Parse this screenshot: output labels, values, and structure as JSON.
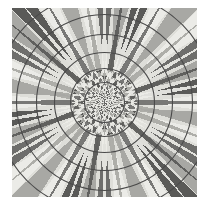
{
  "document": {
    "title": "Radial Moire Pattern",
    "kind": "optical-illusion-figure",
    "background_color": "#ffffff"
  },
  "figure": {
    "name": "radial-checkerboard-with-concentric-circles",
    "bounds": {
      "x": 12,
      "y": 8,
      "width": 185,
      "height": 189
    },
    "center": {
      "x": 104.5,
      "y": 102.5
    },
    "colors": {
      "light_wedge": "#ebebe7",
      "mid_wedge": "#a8a8a4",
      "dark_wedge": "#6e6e6c",
      "darkest_wedge": "#5a5a58",
      "circle_stroke": "#4a4a4a",
      "page_background": "#ffffff",
      "plate_background": "#dedeD9"
    },
    "radial": {
      "sector_count": 36,
      "sector_angle_degrees": 10,
      "ring_count": 13,
      "ring_growth": "geometric",
      "ring_base_radius": 3.2,
      "ring_growth_factor": 1.235,
      "max_radius": 138,
      "checker_phase_alternates_per_ring": true
    },
    "circles": {
      "stroke_width": 1.1,
      "stroke_color": "#4a4a4a",
      "radii": [
        20,
        34,
        50,
        68,
        88,
        110,
        134
      ]
    }
  }
}
